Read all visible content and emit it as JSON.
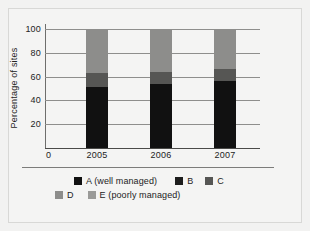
{
  "chart_data": {
    "type": "bar",
    "subtype": "stacked-column",
    "title": "",
    "xlabel": "",
    "ylabel": "Percentage of sites",
    "categories": [
      "2005",
      "2006",
      "2007"
    ],
    "ylim": [
      0,
      100
    ],
    "yticks": [
      0,
      20,
      40,
      60,
      80,
      100
    ],
    "ytick_labels": [
      "0",
      "20",
      "40",
      "60",
      "80",
      "100"
    ],
    "grid": true,
    "legend_position": "bottom",
    "series": [
      {
        "name": "A (well managed)",
        "color": "#111111",
        "values": [
          51,
          54,
          56
        ]
      },
      {
        "name": "B",
        "color": "#1d1d1d",
        "values": [
          0,
          0,
          0
        ]
      },
      {
        "name": "C",
        "color": "#565654",
        "values": [
          12,
          10,
          10
        ]
      },
      {
        "name": "D",
        "color": "#8d8d8b",
        "values": [
          37,
          36,
          34
        ]
      },
      {
        "name": "E (poorly managed)",
        "color": "#9a9a98",
        "values": [
          0,
          0,
          0
        ]
      }
    ]
  },
  "axes": {
    "y_title": "Percentage of sites",
    "y_ticks": [
      "0",
      "20",
      "40",
      "60",
      "80",
      "100"
    ],
    "x_ticks": [
      "2005",
      "2006",
      "2007"
    ],
    "x_origin_label": "0"
  },
  "legend": {
    "rows": [
      [
        {
          "label": "A (well managed)",
          "color": "#111111",
          "swatch": "legend-swatch-a"
        },
        {
          "label": "B",
          "color": "#1d1d1d",
          "swatch": "legend-swatch-b"
        },
        {
          "label": "C",
          "color": "#565654",
          "swatch": "legend-swatch-c"
        }
      ],
      [
        {
          "label": "D",
          "color": "#8d8d8b",
          "swatch": "legend-swatch-d"
        },
        {
          "label": "E (poorly managed)",
          "color": "#9a9a98",
          "swatch": "legend-swatch-e"
        }
      ]
    ]
  },
  "colors": {
    "page_background": "#f2f2f1",
    "panel_background": "#f4f4f3",
    "frame_border": "#d8d8d6",
    "gridline": "#8e8e8c",
    "axis": "#4a4a48",
    "text": "#232323",
    "series_a": "#111111",
    "series_b": "#1d1d1d",
    "series_c": "#565654",
    "series_d": "#8d8d8b",
    "series_e": "#9a9a98"
  }
}
